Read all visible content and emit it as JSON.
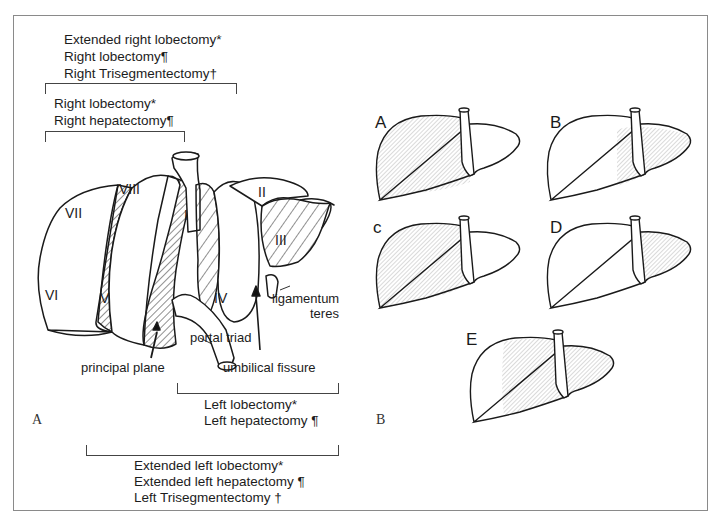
{
  "figure": {
    "panel_a": {
      "label": "A",
      "right_resections": {
        "extended": [
          "Extended right lobectomy*",
          "Right lobectomy¶",
          "Right Trisegmentectomy†"
        ],
        "standard": [
          "Right lobectomy*",
          "Right hepatectomy¶"
        ]
      },
      "left_resections": {
        "standard": [
          "Left lobectomy*",
          "Left hepatectomy ¶"
        ],
        "extended": [
          "Extended left lobectomy*",
          "Extended left hepatectomy ¶",
          "Left Trisegmentectomy †"
        ]
      },
      "segments": [
        "I",
        "II",
        "III",
        "IV",
        "V",
        "VI",
        "VII",
        "VIII"
      ],
      "annotations": {
        "ligamentum_teres": [
          "ligamentum",
          "teres"
        ],
        "portal_triad": "portal triad",
        "principal_plane": "principal plane",
        "umbilical_fissure": "umbilical fissure"
      }
    },
    "panel_b": {
      "label": "B",
      "livers": [
        {
          "label": "A",
          "shaded": "right lobe"
        },
        {
          "label": "B",
          "shaded": "left lobe + medial"
        },
        {
          "label": "c",
          "shaded": "right lobe extended"
        },
        {
          "label": "D",
          "shaded": "left lateral"
        },
        {
          "label": "E",
          "shaded": "extended left"
        }
      ]
    },
    "colors": {
      "line": "#1a1a1a",
      "shade": "#c8c8c8",
      "frame": "#8a8a8a"
    }
  }
}
